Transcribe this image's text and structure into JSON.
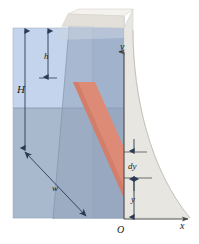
{
  "figure": {
    "type": "engineering-diagram"
  },
  "labels": {
    "depth_h": "h",
    "total_depth_H": "H",
    "width_w": "w",
    "axis_y": "y",
    "axis_x": "x",
    "origin": "O",
    "strip_thickness_dy": "dy",
    "height_y": "y"
  },
  "colors": {
    "water_upper": "#bcd0ea",
    "water_lower": "#a8b8cd",
    "water_face_upper": "#a9bcd8",
    "water_face_lower": "#9aabc2",
    "dam_body": "#e6e4df",
    "dam_crest_light": "#f2f0ec",
    "dam_crest_mid": "#dcd9d2",
    "strip_red": "#dd8a77",
    "strip_red_dark": "#cf7a66",
    "axis_line": "#4a4a4a",
    "arrow": "#2b3a52",
    "outline": "#6d7a8c",
    "label_text": "#1a1a1a"
  },
  "geometry": {
    "axis_origin_x": 124,
    "axis_origin_y": 219,
    "axis_y_top": 52,
    "axis_x_right": 190,
    "water_surface_y": 108,
    "water_block_top": 28,
    "water_block_bottom": 218,
    "strip_top_y": 152,
    "strip_bottom_y": 178
  }
}
